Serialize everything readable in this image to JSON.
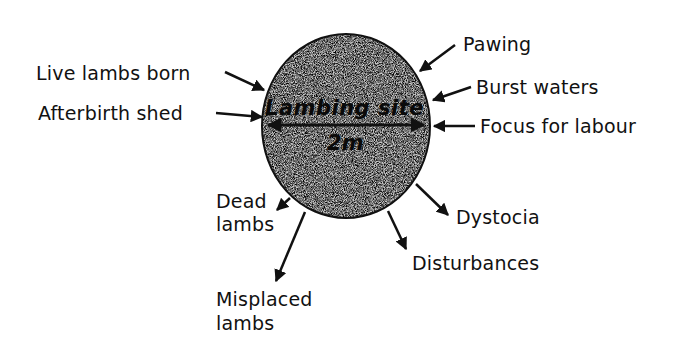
{
  "diagram": {
    "center": {
      "title": "Lambing site",
      "measure": "2m"
    },
    "inputs": [
      {
        "id": "pawing",
        "label": "Pawing"
      },
      {
        "id": "burst-waters",
        "label": "Burst waters"
      },
      {
        "id": "focus-for-labour",
        "label": "Focus for labour"
      },
      {
        "id": "live-lambs-born",
        "label": "Live lambs born"
      },
      {
        "id": "afterbirth-shed",
        "label": "Afterbirth shed"
      }
    ],
    "outputs": [
      {
        "id": "dead-lambs",
        "label_line1": "Dead",
        "label_line2": "lambs"
      },
      {
        "id": "misplaced-lambs",
        "label_line1": "Misplaced",
        "label_line2": "lambs"
      },
      {
        "id": "disturbances",
        "label": "Disturbances"
      },
      {
        "id": "dystocia",
        "label": "Dystocia"
      }
    ]
  }
}
